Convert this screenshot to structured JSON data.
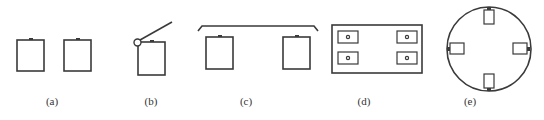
{
  "figure": {
    "panels": [
      {
        "id": "a",
        "label": "(a)",
        "description": "two separate boxes with top lugs"
      },
      {
        "id": "b",
        "label": "(b)",
        "description": "box with hinged pivot and angled arm"
      },
      {
        "id": "c",
        "label": "(c)",
        "description": "two boxes under a common bracket"
      },
      {
        "id": "d",
        "label": "(d)",
        "description": "rectangular frame with four small boxes with center dots"
      },
      {
        "id": "e",
        "label": "(e)",
        "description": "circle with four boxes at cardinal positions"
      }
    ],
    "colors": {
      "line": "#3a3a3a",
      "background": "#ffffff"
    }
  }
}
